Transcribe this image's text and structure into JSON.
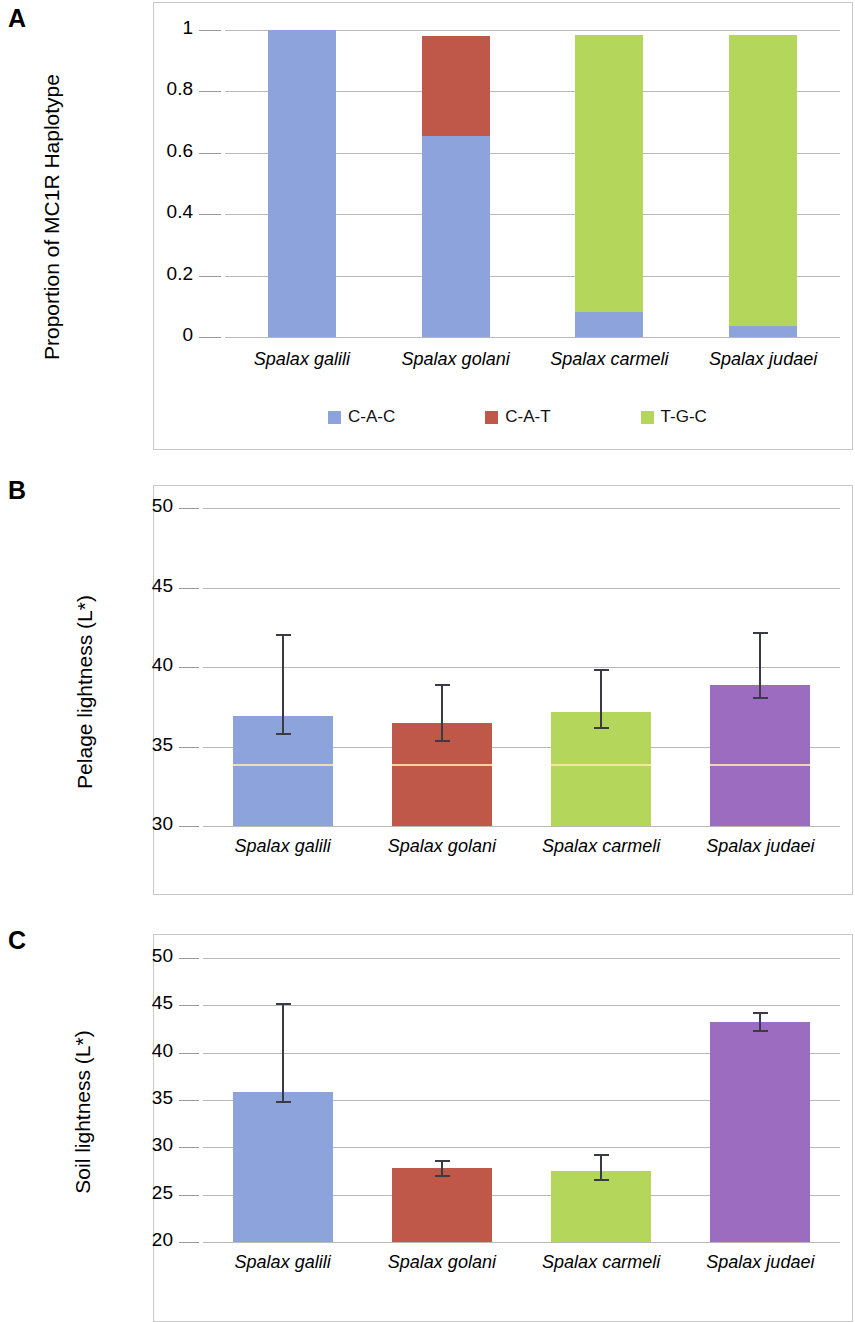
{
  "figure": {
    "panels": [
      "A",
      "B",
      "C"
    ],
    "categories": [
      "Spalax galili",
      "Spalax golani",
      "Spalax carmeli",
      "Spalax judaei"
    ],
    "colors": {
      "blue": "#8ca3db",
      "red": "#c0584a",
      "green": "#b4d65a",
      "purple": "#9b6cc0",
      "error_bar": "#3b3b45",
      "gridline": "#b8b8b8",
      "frame": "#c9c9c9"
    }
  },
  "panelA": {
    "letter": "A",
    "ylabel": "Proportion of MC1R Haplotype",
    "yticks": [
      "1",
      "0.8",
      "0.6",
      "0.4",
      "0.2",
      "0"
    ],
    "legend": [
      {
        "label": "C-A-C",
        "color": "#8ca3db"
      },
      {
        "label": "C-A-T",
        "color": "#c0584a"
      },
      {
        "label": "T-G-C",
        "color": "#b4d65a"
      }
    ]
  },
  "panelB": {
    "letter": "B",
    "ylabel": "Pelage lightness (L*)",
    "yticks": [
      "50",
      "45",
      "40",
      "35",
      "30"
    ]
  },
  "panelC": {
    "letter": "C",
    "ylabel": "Soil lightness (L*)",
    "yticks": [
      "50",
      "45",
      "40",
      "35",
      "30",
      "25",
      "20"
    ]
  },
  "chart_data": [
    {
      "type": "bar",
      "panel": "A",
      "stacked": true,
      "title": "",
      "xlabel": "",
      "ylabel": "Proportion of MC1R Haplotype",
      "ylim": [
        0,
        1
      ],
      "yticks": [
        0,
        0.2,
        0.4,
        0.6,
        0.8,
        1
      ],
      "grid": true,
      "legend": "bottom",
      "categories": [
        "Spalax galili",
        "Spalax golani",
        "Spalax carmeli",
        "Spalax judaei"
      ],
      "series": [
        {
          "name": "C-A-C",
          "color": "#8ca3db",
          "values": [
            1.0,
            0.655,
            0.08,
            0.035
          ]
        },
        {
          "name": "C-A-T",
          "color": "#c0584a",
          "values": [
            0.0,
            0.325,
            0.0,
            0.0
          ]
        },
        {
          "name": "T-G-C",
          "color": "#b4d65a",
          "values": [
            0.0,
            0.0,
            0.905,
            0.95
          ]
        }
      ]
    },
    {
      "type": "bar",
      "panel": "B",
      "stacked": false,
      "title": "",
      "xlabel": "",
      "ylabel": "Pelage lightness (L*)",
      "ylim": [
        30,
        50
      ],
      "yticks": [
        30,
        35,
        40,
        45,
        50
      ],
      "grid": true,
      "categories": [
        "Spalax galili",
        "Spalax golani",
        "Spalax carmeli",
        "Spalax judaei"
      ],
      "values": [
        36.9,
        36.5,
        37.2,
        38.9
      ],
      "error_low": [
        35.7,
        35.3,
        36.1,
        38.0
      ],
      "error_high": [
        42.1,
        38.9,
        39.9,
        42.2
      ],
      "colors": [
        "#8ca3db",
        "#c0584a",
        "#b4d65a",
        "#9b6cc0"
      ]
    },
    {
      "type": "bar",
      "panel": "C",
      "stacked": false,
      "title": "",
      "xlabel": "",
      "ylabel": "Soil lightness (L*)",
      "ylim": [
        20,
        50
      ],
      "yticks": [
        20,
        25,
        30,
        35,
        40,
        45,
        50
      ],
      "grid": true,
      "categories": [
        "Spalax galili",
        "Spalax golani",
        "Spalax carmeli",
        "Spalax judaei"
      ],
      "values": [
        35.8,
        27.8,
        27.5,
        43.2
      ],
      "error_low": [
        34.7,
        26.9,
        26.4,
        42.2
      ],
      "error_high": [
        45.2,
        28.7,
        29.3,
        44.3
      ],
      "colors": [
        "#8ca3db",
        "#c0584a",
        "#b4d65a",
        "#9b6cc0"
      ]
    }
  ]
}
